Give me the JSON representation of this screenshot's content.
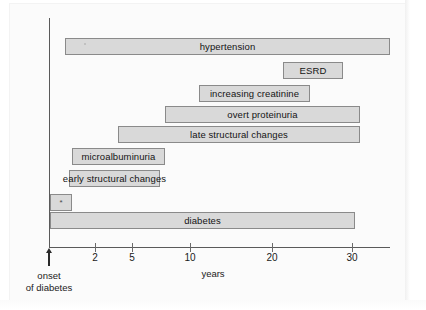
{
  "figure": {
    "type": "timeline-bar-diagram",
    "axis_title": "years",
    "onset_caption_line1": "onset",
    "onset_caption_line2": "of diabetes"
  },
  "chart_data": {
    "type": "bar",
    "orientation": "horizontal",
    "title": "",
    "subtitle": "",
    "xlabel": "years",
    "ylabel": "",
    "xscale": "log",
    "xlim": [
      0.8,
      45
    ],
    "grid": false,
    "legend": null,
    "annotations": [
      "onset of diabetes"
    ],
    "axis_ticks": [
      {
        "label": "2",
        "value": 2,
        "x": 95
      },
      {
        "label": "5",
        "value": 5,
        "x": 132
      },
      {
        "label": "10",
        "value": 10,
        "x": 190
      },
      {
        "label": "20",
        "value": 20,
        "x": 272
      },
      {
        "label": "30",
        "value": 30,
        "x": 352
      }
    ],
    "categories": [
      "hypertension",
      "ESRD",
      "increasing creatinine",
      "overt proteinuria",
      "late structural changes",
      "microalbuminuria",
      "early structural changes",
      "*",
      "diabetes"
    ],
    "bars": [
      {
        "label": "hypertension",
        "x": 65,
        "y": 38,
        "width": 325,
        "overflow": false,
        "speck": true
      },
      {
        "label": "ESRD",
        "x": 283,
        "y": 62,
        "width": 60,
        "overflow": false,
        "speck": false
      },
      {
        "label": "increasing creatinine",
        "x": 199,
        "y": 85,
        "width": 111,
        "overflow": false,
        "speck": false
      },
      {
        "label": "overt proteinuria",
        "x": 165,
        "y": 106,
        "width": 195,
        "overflow": false,
        "speck": false
      },
      {
        "label": "late structural changes",
        "x": 118,
        "y": 126,
        "width": 242,
        "overflow": false,
        "speck": false
      },
      {
        "label": "microalbuminuria",
        "x": 72,
        "y": 148,
        "width": 93,
        "overflow": false,
        "speck": false
      },
      {
        "label": "early structural changes",
        "x": 69,
        "y": 170,
        "width": 91,
        "overflow": true,
        "speck": false
      },
      {
        "label": "*",
        "x": 50,
        "y": 194,
        "width": 22,
        "overflow": false,
        "speck": false
      },
      {
        "label": "diabetes",
        "x": 50,
        "y": 212,
        "width": 305,
        "overflow": false,
        "speck": false
      }
    ]
  },
  "colors": {
    "bar_fill": "#d9d9d9",
    "bar_border": "#8a8a8a",
    "axis": "#5a5a5a",
    "text": "#141414",
    "page": "#fbfbfb"
  }
}
